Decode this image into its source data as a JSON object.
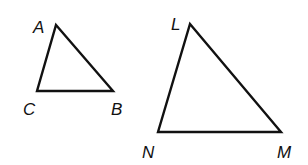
{
  "diagram": {
    "type": "geometry",
    "stroke_color": "#111111",
    "background": "#ffffff",
    "triangles": [
      {
        "name": "ABC",
        "vertices": [
          {
            "label": "A",
            "x": 56,
            "y": 25,
            "label_x": 33,
            "label_y": 33
          },
          {
            "label": "B",
            "x": 113,
            "y": 91,
            "label_x": 111,
            "label_y": 115
          },
          {
            "label": "C",
            "x": 37,
            "y": 91,
            "label_x": 23,
            "label_y": 115
          }
        ]
      },
      {
        "name": "LMN",
        "vertices": [
          {
            "label": "L",
            "x": 190,
            "y": 24,
            "label_x": 171,
            "label_y": 30
          },
          {
            "label": "M",
            "x": 281,
            "y": 132,
            "label_x": 277,
            "label_y": 158
          },
          {
            "label": "N",
            "x": 158,
            "y": 132,
            "label_x": 142,
            "label_y": 158
          }
        ]
      }
    ]
  }
}
